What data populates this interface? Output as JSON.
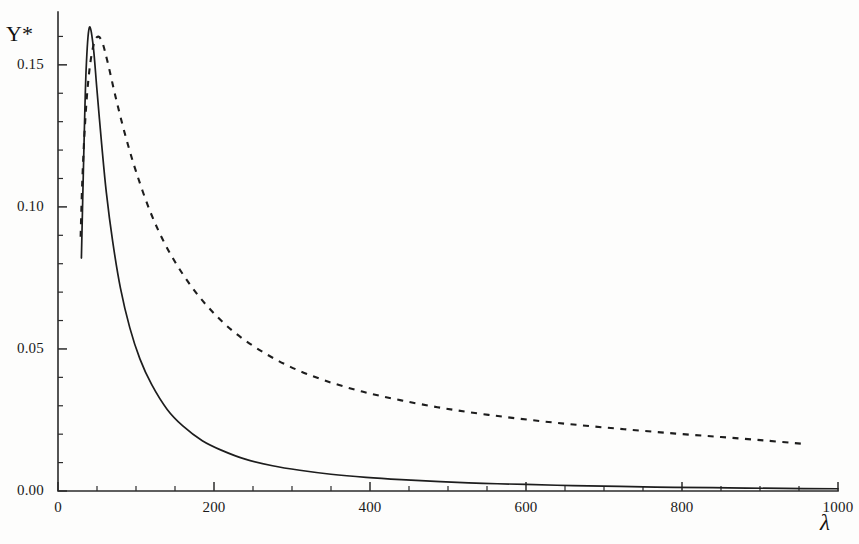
{
  "figure": {
    "background_color": "#fdfdfc",
    "ink_color": "#1d1d1d"
  },
  "axes": {
    "y_title": "Y*",
    "x_title": "λ",
    "x_tick_labels": [
      "0",
      "200",
      "400",
      "600",
      "800",
      "1000"
    ],
    "y_tick_labels": [
      "0.00",
      "0.05",
      "0.10",
      "0.15"
    ]
  },
  "chart_data": {
    "type": "line",
    "title": "",
    "xlabel": "λ",
    "ylabel": "Y*",
    "xlim": [
      0,
      1000
    ],
    "ylim": [
      0.0,
      0.17
    ],
    "grid": false,
    "legend": "none",
    "x_ticks": [
      0,
      200,
      400,
      600,
      800,
      1000
    ],
    "y_ticks": [
      0.0,
      0.05,
      0.1,
      0.15
    ],
    "x_minor_tick_step": 50,
    "y_minor_tick_step": 0.01,
    "series": [
      {
        "name": "solid",
        "style": "solid",
        "color": "#1d1d1d",
        "x": [
          30,
          33,
          36,
          40,
          45,
          50,
          56,
          62,
          70,
          80,
          92,
          105,
          120,
          140,
          160,
          185,
          210,
          240,
          275,
          310,
          350,
          395,
          440,
          490,
          545,
          600,
          660,
          720,
          790,
          860,
          930,
          1000
        ],
        "y": [
          0.082,
          0.118,
          0.148,
          0.163,
          0.157,
          0.141,
          0.122,
          0.105,
          0.088,
          0.0715,
          0.0575,
          0.0465,
          0.0375,
          0.0287,
          0.0229,
          0.0177,
          0.0143,
          0.0112,
          0.0089,
          0.0073,
          0.0059,
          0.0048,
          0.004,
          0.0033,
          0.0027,
          0.0023,
          0.0019,
          0.0016,
          0.0013,
          0.0011,
          0.0009,
          0.0008
        ]
      },
      {
        "name": "dashed",
        "style": "dashed",
        "color": "#1d1d1d",
        "x": [
          29,
          31,
          34,
          38,
          43,
          49,
          56,
          64,
          74,
          86,
          100,
          118,
          138,
          162,
          190,
          222,
          258,
          298,
          342,
          390,
          440,
          495,
          552,
          612,
          672,
          732,
          792,
          850,
          905,
          955
        ],
        "y": [
          0.0895,
          0.108,
          0.126,
          0.142,
          0.1535,
          0.1595,
          0.1585,
          0.1505,
          0.1385,
          0.1255,
          0.1125,
          0.0985,
          0.0865,
          0.0755,
          0.0655,
          0.0568,
          0.0497,
          0.0437,
          0.0389,
          0.035,
          0.0319,
          0.0291,
          0.0268,
          0.0248,
          0.0231,
          0.0216,
          0.0202,
          0.019,
          0.0178,
          0.0166
        ]
      }
    ]
  }
}
